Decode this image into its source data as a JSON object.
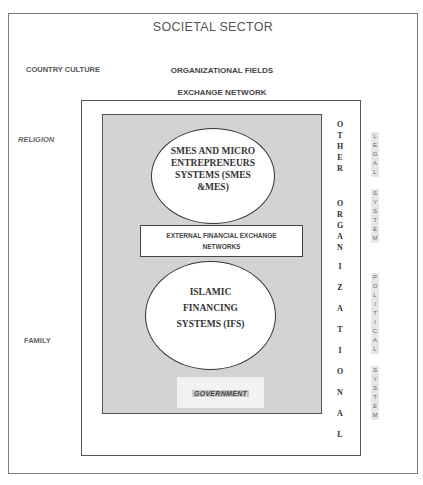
{
  "diagram": {
    "title": "SOCIETAL SECTOR",
    "left_labels": {
      "country_culture": "COUNTRY CULTURE",
      "religion": "RELIGION",
      "family": "FAMILY"
    },
    "organizational_fields": "ORGANIZATIONAL FIELDS",
    "exchange_network": "EXCHANGE NETWORK",
    "smes_ellipse": "SMES AND MICRO ENTREPRENEURS SYSTEMS (SMES &MES)",
    "external_box": "EXTERNAL FINANCIAL EXCHANGE NETWORKS",
    "ifs_ellipse": "ISLAMIC FINANCING SYSTEMS (IFS)",
    "government": "GOVERNMENT",
    "other_organizational": {
      "words": [
        "OTHER",
        "ORGANIZATIONAL"
      ],
      "letters_1": [
        "O",
        "T",
        "H",
        "E",
        "R"
      ],
      "letters_2": [
        "O",
        "R",
        "G",
        "A",
        "N",
        "I",
        "Z",
        "A",
        "T",
        "I",
        "O",
        "N",
        "A",
        "L"
      ]
    },
    "legal_system": {
      "text": "LEGAL SYSTEM",
      "letters_1": [
        "L",
        "E",
        "G",
        "A",
        "L"
      ],
      "letters_2": [
        "S",
        "Y",
        "S",
        "T",
        "E",
        "M"
      ]
    },
    "political_system": {
      "text": "POLITICAL SYSTEM",
      "letters_1": [
        "P",
        "O",
        "L",
        "I",
        "T",
        "I",
        "C",
        "A",
        "L"
      ],
      "letters_2": [
        "S",
        "Y",
        "S",
        "T",
        "E",
        "M"
      ]
    }
  }
}
